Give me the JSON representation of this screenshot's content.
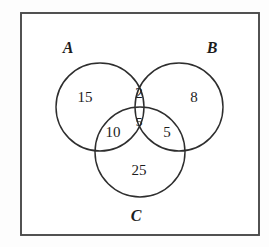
{
  "figure": {
    "type": "venn-diagram",
    "set_count": 3,
    "background_color": "#fdfdfd",
    "border_color": "#4a4a4a",
    "circle_stroke_color": "#2e2e2e",
    "text_color": "#1d1d1d"
  },
  "universe": {
    "shape": "rectangle",
    "x": 21,
    "y": 13,
    "width": 238,
    "height": 222
  },
  "sets": [
    {
      "id": "A",
      "label": "A",
      "label_x": 68,
      "label_y": 53,
      "cx": 100,
      "cy": 107,
      "r": 44
    },
    {
      "id": "B",
      "label": "B",
      "label_x": 212,
      "label_y": 53,
      "cx": 179,
      "cy": 107,
      "r": 44
    },
    {
      "id": "C",
      "label": "C",
      "label_x": 136,
      "label_y": 221,
      "cx": 140,
      "cy": 152,
      "r": 45
    }
  ],
  "regions": [
    {
      "id": "A-only",
      "sets": "A",
      "value": "15",
      "x": 85,
      "y": 102,
      "size": "normal"
    },
    {
      "id": "B-only",
      "sets": "B",
      "value": "8",
      "x": 194,
      "y": 102,
      "size": "normal"
    },
    {
      "id": "C-only",
      "sets": "C",
      "value": "25",
      "x": 139,
      "y": 175,
      "size": "normal"
    },
    {
      "id": "A-and-B",
      "sets": "A,B",
      "value": "2",
      "x": 139,
      "y": 98,
      "size": "normal"
    },
    {
      "id": "A-and-C",
      "sets": "A,C",
      "value": "10",
      "x": 113,
      "y": 137,
      "size": "normal"
    },
    {
      "id": "B-and-C",
      "sets": "B,C",
      "value": "5",
      "x": 167,
      "y": 137,
      "size": "normal"
    },
    {
      "id": "A-and-B-and-C",
      "sets": "A,B,C",
      "value": "5",
      "x": 139,
      "y": 126,
      "size": "small"
    }
  ],
  "chart_data": {
    "type": "venn",
    "title": "",
    "sets": [
      "A",
      "B",
      "C"
    ],
    "region_labels": [
      "A only",
      "B only",
      "C only",
      "A and B only",
      "A and C only",
      "B and C only",
      "A and B and C"
    ],
    "region_values": [
      15,
      8,
      25,
      2,
      10,
      5,
      5
    ],
    "total": 70,
    "universe_shown": true,
    "universe_label": ""
  }
}
